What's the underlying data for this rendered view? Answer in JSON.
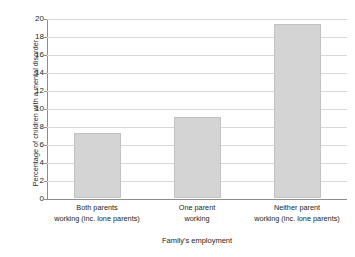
{
  "chart_data": {
    "type": "bar",
    "title": "",
    "subtitle": "",
    "xlabel": "Family's employment",
    "ylabel": "Percentage of children with a mental disorder",
    "categories": [
      "Both parents\nworking (inc. lone parents)",
      "One parent\nworking",
      "Neither parent\nworking (inc. lone parents)"
    ],
    "category_lines": [
      [
        "Both parents",
        "working (inc. lone parents)"
      ],
      [
        "One parent",
        "working"
      ],
      [
        "Neither parent",
        "working (inc. lone parents)"
      ]
    ],
    "values": [
      7.2,
      9.0,
      19.3
    ],
    "ylim": [
      0,
      20
    ],
    "ytick_step": 2,
    "ytick_labels": [
      "0",
      "2",
      "4",
      "6",
      "8",
      "10",
      "12",
      "14",
      "16",
      "18",
      "20"
    ],
    "grid": true,
    "grid_axis": "y",
    "legend": false,
    "legend_position": "none",
    "bar_color": "#d4d4d4",
    "bar_border_color": "#c2c2c2",
    "gridline_color": "#d9d9d9",
    "axis_color": "#8c8c8c",
    "text_color": "#231f20",
    "background_color": "#ffffff"
  }
}
